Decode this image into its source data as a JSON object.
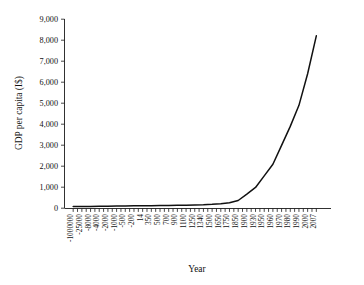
{
  "chart_data": {
    "type": "line",
    "title": "",
    "subtitle": "",
    "xlabel": "Year",
    "ylabel": "GDP per capita (I$)",
    "ylim": [
      0,
      9000
    ],
    "ytick_values": [
      0,
      1000,
      2000,
      3000,
      4000,
      5000,
      6000,
      7000,
      8000,
      9000
    ],
    "ytick_labels": [
      "0",
      "1,000",
      "2,000",
      "3,000",
      "4,000",
      "5,000",
      "6,000",
      "7,000",
      "8,000",
      "9,000"
    ],
    "grid": false,
    "legend": "none",
    "x_axis_type": "categorical",
    "categories": [
      "-1000000",
      "-25000",
      "-8000",
      "-4000",
      "-2000",
      "-1000",
      "-500",
      "-200",
      "14",
      "350",
      "500",
      "700",
      "900",
      "1100",
      "1250",
      "1340",
      "1500",
      "1650",
      "1750",
      "1850",
      "1900",
      "1930",
      "1950",
      "1960",
      "1970",
      "1980",
      "1990",
      "2000",
      "2007"
    ],
    "series": [
      {
        "name": "GDP per capita (I$)",
        "color": "#111111",
        "values": [
          90,
          95,
          100,
          105,
          110,
          115,
          120,
          125,
          130,
          135,
          140,
          145,
          150,
          160,
          170,
          180,
          200,
          230,
          270,
          380,
          680,
          1000,
          1550,
          2100,
          3000,
          3900,
          4900,
          6400,
          8200
        ]
      }
    ],
    "annotations": []
  },
  "figure": {
    "background_color": "#ffffff",
    "axis_color": "#1a1a1a",
    "text_color": "#111111"
  }
}
